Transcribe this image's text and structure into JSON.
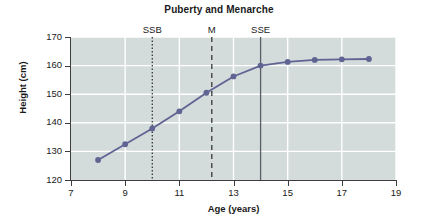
{
  "chart_data": {
    "type": "line",
    "title": "Puberty and Menarche",
    "xlabel": "Age (years)",
    "ylabel": "Height (cm)",
    "xlim": [
      7,
      19
    ],
    "ylim": [
      120,
      170
    ],
    "xticks": [
      7,
      9,
      11,
      13,
      15,
      17,
      19
    ],
    "yticks": [
      120,
      130,
      140,
      150,
      160,
      170
    ],
    "xtick_labels": [
      "7",
      "9",
      "11",
      "13",
      "15",
      "17",
      "19"
    ],
    "ytick_labels": [
      "120",
      "130",
      "140",
      "150",
      "160",
      "170"
    ],
    "grid": true,
    "legend": "none",
    "plot_bgcolor": "#d3dbdb",
    "gridcolor": "#ffffff",
    "line_color": "#5f6493",
    "marker_color": "#5f6493",
    "x": [
      8,
      9,
      10,
      11,
      12,
      13,
      14,
      15,
      16,
      17,
      18
    ],
    "values": [
      127.0,
      132.5,
      138.0,
      144.0,
      150.5,
      156.2,
      160.0,
      161.3,
      162.0,
      162.2,
      162.3
    ],
    "series": [
      {
        "name": "Height",
        "x": [
          8,
          9,
          10,
          11,
          12,
          13,
          14,
          15,
          16,
          17,
          18
        ],
        "values": [
          127.0,
          132.5,
          138.0,
          144.0,
          150.5,
          156.2,
          160.0,
          161.3,
          162.0,
          162.2,
          162.3
        ]
      }
    ],
    "annotations": [
      {
        "label": "SSB",
        "x": 10.0,
        "style": "dotted",
        "color": "#1a1a1a"
      },
      {
        "label": "M",
        "x": 12.2,
        "style": "dashed",
        "color": "#1a1a1a"
      },
      {
        "label": "SSE",
        "x": 14.0,
        "style": "solid",
        "color": "#5a5f66"
      }
    ]
  }
}
